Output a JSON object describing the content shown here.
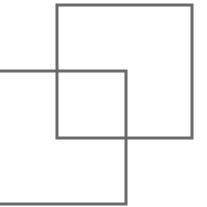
{
  "canvas": {
    "width": 207,
    "height": 207,
    "background": "#ffffff"
  },
  "stroke": {
    "color": "#6a6a6a",
    "width": 3
  },
  "shapes": [
    {
      "id": "upper-right-square",
      "type": "rect",
      "x": 57,
      "y": 5,
      "width": 135,
      "height": 133
    },
    {
      "id": "lower-left-square",
      "type": "rect",
      "x": -10,
      "y": 71,
      "width": 136,
      "height": 133
    }
  ]
}
